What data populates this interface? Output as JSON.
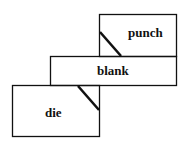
{
  "diagram": {
    "labels": {
      "punch": "punch",
      "blank": "blank",
      "die": "die"
    },
    "colors": {
      "stroke": "#111111",
      "background": "#ffffff"
    }
  }
}
